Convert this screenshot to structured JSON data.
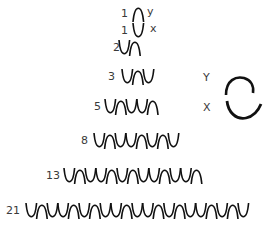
{
  "diagram": {
    "symbols": {
      "X": "cup",
      "Y": "arch"
    },
    "stroke_color": "#111111",
    "rows": [
      {
        "label": "1",
        "seq": "Y",
        "suffix": "y",
        "label_x": 121,
        "wave_x": 133,
        "y": 14,
        "suffix_x": 147
      },
      {
        "label": "1",
        "seq": "X",
        "suffix": "x",
        "label_x": 121,
        "wave_x": 133,
        "y": 31,
        "suffix_x": 150
      },
      {
        "label": "2",
        "seq": "XY",
        "label_x": 113,
        "wave_x": 119,
        "y": 48
      },
      {
        "label": "3",
        "seq": "XYX",
        "label_x": 108,
        "wave_x": 122,
        "y": 77
      },
      {
        "label": "5",
        "seq": "XYXXY",
        "label_x": 94,
        "wave_x": 105,
        "y": 107
      },
      {
        "label": "8",
        "seq": "XYXXYXYX",
        "label_x": 81,
        "wave_x": 94,
        "y": 141
      },
      {
        "label": "13",
        "seq": "XYXXYXYXXYXXY",
        "label_x": 46,
        "wave_x": 64,
        "y": 176
      },
      {
        "label": "21",
        "seq": "XYXXYXYXXYXXYXYXXYXYX",
        "label_x": 6,
        "wave_x": 26,
        "y": 211
      }
    ],
    "legend": {
      "items": [
        {
          "key": "Y",
          "shape": "arch",
          "label_x": 203,
          "y": 78
        },
        {
          "key": "X",
          "shape": "cup",
          "label_x": 203,
          "y": 108
        }
      ]
    }
  }
}
